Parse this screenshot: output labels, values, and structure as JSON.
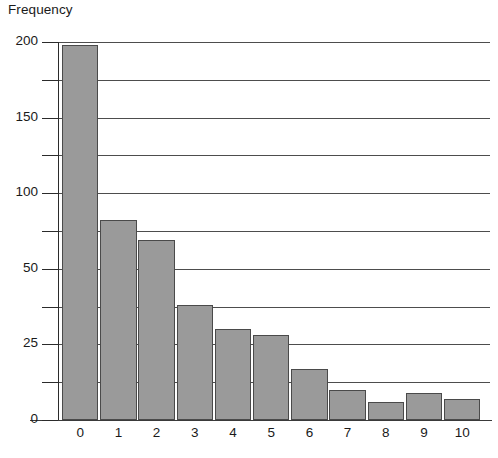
{
  "chart_data": {
    "type": "bar",
    "title": "",
    "subtitle": "",
    "xlabel": "",
    "ylabel": "Frequency",
    "categories": [
      "0",
      "1",
      "2",
      "3",
      "4",
      "5",
      "6",
      "7",
      "8",
      "9",
      "10"
    ],
    "values": [
      198,
      82,
      69,
      38,
      30,
      28,
      17,
      10,
      6,
      9,
      7
    ],
    "series": [
      {
        "name": "Frequency",
        "values": [
          198,
          82,
          69,
          38,
          30,
          28,
          17,
          10,
          6,
          9,
          7
        ]
      }
    ],
    "ytick_labels": [
      "0",
      "25",
      "50",
      "100",
      "150",
      "200"
    ],
    "ytick_values": [
      0,
      25,
      50,
      100,
      150,
      200
    ],
    "all_tick_values": [
      0,
      12.5,
      25,
      37.5,
      50,
      75,
      100,
      125,
      150,
      175,
      200
    ],
    "ylim": [
      0,
      200
    ],
    "grid": true,
    "legend": false,
    "legend_position": "none",
    "bar_color": "#9a9a9a",
    "bar_edge_color": "#4a4a4a",
    "grid_color": "#4d4d4d",
    "axis_color": "#2b2b2b",
    "background": "#ffffff",
    "note": "Y axis uses an irregular broken scale: evenly spaced ticks correspond to 0, 12.5, 25, 37.5, 50, 75, 100, 125, 150, 175, 200."
  },
  "axis": {
    "y_title": "Frequency"
  }
}
